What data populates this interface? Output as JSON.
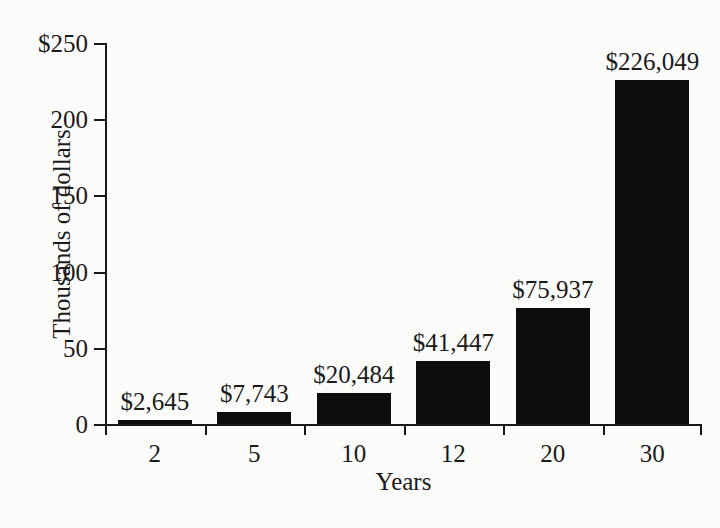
{
  "chart_data": {
    "type": "bar",
    "title": "",
    "subtitle": "",
    "xlabel": "Years",
    "ylabel": "Thousands of dollars",
    "categories": [
      "2",
      "5",
      "10",
      "12",
      "20",
      "30"
    ],
    "values": [
      2.645,
      7.743,
      20.484,
      41.447,
      75.937,
      226.049
    ],
    "value_labels": [
      "$2,645",
      "$7,743",
      "$20,484",
      "$41,447",
      "$75,937",
      "$226,049"
    ],
    "ylim": [
      0,
      250
    ],
    "yticks": [
      0,
      50,
      100,
      150,
      200,
      250
    ],
    "ytick_labels": [
      "0",
      "50",
      "100",
      "150",
      "200",
      "$250"
    ],
    "grid": false,
    "legend": false,
    "bar_color": "#0d0d0d",
    "background_color": "#fbfbfa",
    "axis_color": "#171717"
  },
  "axes": {
    "y_title": "Thousands of dollars",
    "x_title": "Years"
  }
}
